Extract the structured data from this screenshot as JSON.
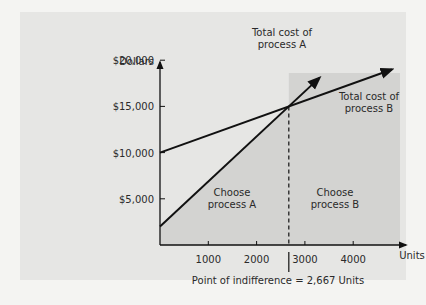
{
  "chart_data": {
    "type": "line",
    "title": "",
    "xlabel": "Units",
    "ylabel": "Dollars",
    "xlim": [
      0,
      5000
    ],
    "ylim": [
      0,
      22000
    ],
    "x_ticks": [
      1000,
      2000,
      3000,
      4000
    ],
    "x_tick_labels": [
      "1000",
      "2000",
      "3000",
      "4000"
    ],
    "y_ticks": [
      5000,
      10000,
      15000,
      20000
    ],
    "y_tick_labels": [
      "$5,000",
      "$10,000",
      "$15,000",
      "$20,000"
    ],
    "series": [
      {
        "name": "Total cost of process A",
        "fixed_cost": 2000,
        "variable_cost_per_unit": 4.875,
        "x": [
          0,
          3300
        ],
        "y": [
          2000,
          18087
        ]
      },
      {
        "name": "Total cost of process B",
        "fixed_cost": 10000,
        "variable_cost_per_unit": 1.875,
        "x": [
          0,
          4800
        ],
        "y": [
          10000,
          19000
        ]
      }
    ],
    "annotations": {
      "label_a": [
        "Total cost of",
        "process A"
      ],
      "label_b": [
        "Total cost of",
        "process B"
      ],
      "region_a": [
        "Choose",
        "process A"
      ],
      "region_b": [
        "Choose",
        "process B"
      ],
      "indifference": "Point of indifference = 2,667 Units",
      "indifference_x": 2667,
      "indifference_y": 15000
    },
    "grid": false,
    "legend": "none"
  },
  "colors": {
    "background": "#e6e6e4",
    "region": "#d3d3d1",
    "line": "#111111",
    "text": "#2a2a2a"
  }
}
